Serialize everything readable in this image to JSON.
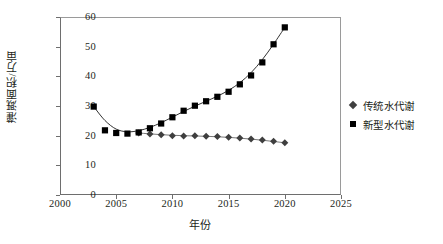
{
  "chart_data": {
    "type": "scatter",
    "title": "",
    "xlabel": "年份",
    "ylabel": "灌溉面积/万亩",
    "xlim": [
      2000,
      2025
    ],
    "ylim": [
      0,
      60
    ],
    "xticks": [
      2000,
      2005,
      2010,
      2015,
      2020,
      2025
    ],
    "yticks": [
      0,
      10,
      20,
      30,
      40,
      50,
      60
    ],
    "grid": false,
    "legend_position": "right",
    "series": [
      {
        "name": "传统水代谢",
        "marker": "diamond",
        "color": "#3f3f3f",
        "has_trendline": true,
        "x": [
          2007,
          2008,
          2009,
          2010,
          2011,
          2012,
          2013,
          2014,
          2015,
          2016,
          2017,
          2018,
          2019,
          2020
        ],
        "values": [
          20.9,
          20.6,
          20.3,
          20.0,
          19.9,
          20.0,
          19.8,
          19.7,
          19.5,
          19.2,
          18.9,
          18.5,
          18.1,
          17.6
        ]
      },
      {
        "name": "新型水代谢",
        "marker": "square",
        "color": "#000000",
        "has_trendline": true,
        "x": [
          2003,
          2004,
          2005,
          2006,
          2007,
          2008,
          2009,
          2010,
          2011,
          2012,
          2013,
          2014,
          2015,
          2016,
          2017,
          2018,
          2019,
          2020
        ],
        "values": [
          29.8,
          21.8,
          20.9,
          20.7,
          21.1,
          22.5,
          24.1,
          26.2,
          28.4,
          30.1,
          31.6,
          33.1,
          34.8,
          37.3,
          40.3,
          44.7,
          50.8,
          56.5
        ]
      }
    ]
  },
  "legend": {
    "items": [
      {
        "label": "传统水代谢",
        "marker": "diamond"
      },
      {
        "label": "新型水代谢",
        "marker": "square"
      }
    ]
  }
}
